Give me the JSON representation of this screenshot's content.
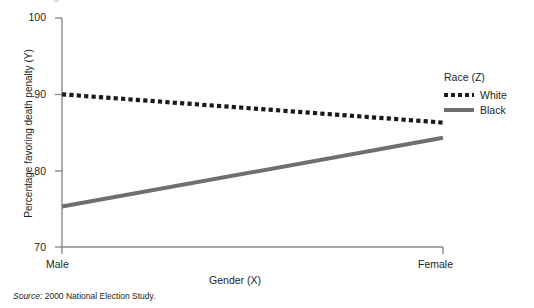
{
  "figure": {
    "top_partial_heading": "Figure 10.4  Interaction",
    "source_prefix": "Source:",
    "source_text": "2000 National Election Study."
  },
  "legend": {
    "title": "Race (Z)",
    "entries": [
      {
        "label": "White",
        "style": "dotted",
        "color": "#1a1a1a"
      },
      {
        "label": "Black",
        "style": "solid",
        "color": "#6f6f6f"
      }
    ]
  },
  "chart_data": {
    "type": "line",
    "title": "",
    "xlabel": "Gender (X)",
    "ylabel": "Percentage favoring death penalty (Y)",
    "categories": [
      "Male",
      "Female"
    ],
    "x": [
      0,
      1
    ],
    "xticklabels": [
      "Male",
      "Female"
    ],
    "yticklabels": [
      "70",
      "80",
      "90",
      "100"
    ],
    "yticks": [
      70,
      80,
      90,
      100
    ],
    "ylim": [
      70,
      100
    ],
    "xlim": [
      0,
      1
    ],
    "grid": false,
    "legend_position": "right",
    "series": [
      {
        "name": "White",
        "style": "dotted",
        "color": "#1a1a1a",
        "values": [
          90.0,
          86.3
        ]
      },
      {
        "name": "Black",
        "style": "solid",
        "color": "#6f6f6f",
        "values": [
          75.3,
          84.3
        ]
      }
    ]
  }
}
